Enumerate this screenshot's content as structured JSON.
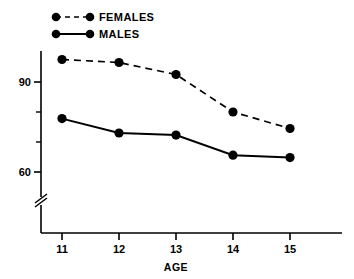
{
  "chart_data": {
    "type": "line",
    "title": "",
    "subtitle": "",
    "xlabel": "AGE",
    "ylabel": "",
    "x": [
      11,
      12,
      13,
      14,
      15
    ],
    "categories": [
      "11",
      "12",
      "13",
      "14",
      "15"
    ],
    "series": [
      {
        "name": "FEMALES",
        "line_style": "dashed",
        "marker": "filled-circle",
        "color": "#000000",
        "values": [
          97.5,
          96.5,
          92.5,
          80.0,
          74.5
        ]
      },
      {
        "name": "MALES",
        "line_style": "solid",
        "marker": "filled-circle",
        "color": "#000000",
        "values": [
          77.8,
          73.0,
          72.3,
          65.6,
          64.8
        ]
      }
    ],
    "xlim": [
      10.5,
      15.9
    ],
    "ylim": [
      55.0,
      101.0
    ],
    "ytick_labels": [
      "90",
      "60"
    ],
    "ytick_values": [
      90,
      60
    ],
    "yminor_tick_values": [
      80,
      70
    ],
    "xtick_labels": [
      "11",
      "12",
      "13",
      "14",
      "15"
    ],
    "grid": false,
    "legend_position": "top-left",
    "axis_break": {
      "axis": "y",
      "symbol": "double-slash",
      "present": true
    }
  },
  "axes": {
    "x_axis_label": "AGE",
    "y_ticks": [
      {
        "label": "90"
      },
      {
        "label": "60"
      }
    ],
    "x_ticks": [
      {
        "label": "11"
      },
      {
        "label": "12"
      },
      {
        "label": "13"
      },
      {
        "label": "14"
      },
      {
        "label": "15"
      }
    ]
  },
  "legend": {
    "items": [
      {
        "label": "FEMALES",
        "style": "dashed"
      },
      {
        "label": "MALES",
        "style": "solid"
      }
    ]
  }
}
